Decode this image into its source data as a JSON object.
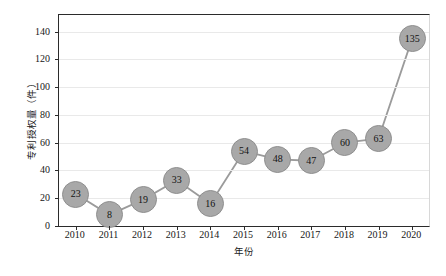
{
  "chart_data": {
    "type": "line",
    "title": "",
    "xlabel": "年份",
    "ylabel": "专利授权量（件）",
    "categories": [
      "2010",
      "2011",
      "2012",
      "2013",
      "2014",
      "2015",
      "2016",
      "2017",
      "2018",
      "2019",
      "2020"
    ],
    "values": [
      23,
      8,
      19,
      33,
      16,
      54,
      48,
      47,
      60,
      63,
      135
    ],
    "series": [
      {
        "name": "专利授权量",
        "values": [
          23,
          8,
          19,
          33,
          16,
          54,
          48,
          47,
          60,
          63,
          135
        ]
      }
    ],
    "data_labels": [
      "23",
      "8",
      "19",
      "33",
      "16",
      "54",
      "48",
      "47",
      "60",
      "63",
      "135"
    ],
    "yticks": [
      0,
      20,
      40,
      60,
      80,
      100,
      120,
      140
    ],
    "ytick_labels": [
      "0",
      "20",
      "40",
      "60",
      "80",
      "100",
      "120",
      "140"
    ],
    "ylim": [
      0,
      152
    ],
    "grid": "horizontal",
    "legend": "none",
    "colors": {
      "marker_fill": "#a8a8a8",
      "marker_edge": "#8f8f8f",
      "line": "#9b9b9b",
      "grid": "#e9e9e9",
      "axis": "#2b2b2b",
      "plot_background": "#ffffff",
      "label_text": "#131313"
    }
  },
  "caption": ""
}
